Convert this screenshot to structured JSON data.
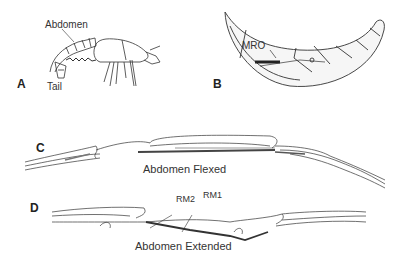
{
  "figure": {
    "panels": {
      "A": {
        "letter": "A",
        "labels": {
          "abdomen": "Abdomen",
          "tail": "Tail"
        }
      },
      "B": {
        "letter": "B",
        "labels": {
          "mro": "MRO"
        }
      },
      "C": {
        "letter": "C",
        "caption": "Abdomen Flexed"
      },
      "D": {
        "letter": "D",
        "caption": "Abdomen Extended",
        "labels": {
          "rm2": "RM2",
          "rm1": "RM1"
        }
      }
    },
    "colors": {
      "ink": "#222222",
      "shade": "#888888",
      "background": "#ffffff"
    }
  }
}
